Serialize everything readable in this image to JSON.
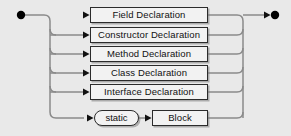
{
  "diagram": {
    "kind": "railroad-syntax-diagram",
    "canvas": {
      "width": 291,
      "height": 136
    },
    "colors": {
      "background": "#e9e9e9",
      "line": "#7a7a7a",
      "node_border": "#2b2b2b",
      "node_fill": "#f2f2f2",
      "terminator": "#000000",
      "text": "#111111"
    },
    "start_node": {
      "name": "start-terminator",
      "shape": "filled-circle",
      "cx": 21,
      "cy": 15,
      "r": 4.2
    },
    "end_node": {
      "name": "end-terminator",
      "shape": "arrow-filled-circle",
      "cx": 275,
      "cy": 15,
      "r": 4.2
    },
    "rails": {
      "left_spine_x": 50,
      "right_spine_x": 243,
      "main_line_y": 15,
      "corner_radius": 6
    },
    "alternatives": [
      {
        "id": "field-declaration",
        "label": "Field Declaration",
        "shape": "rect",
        "x": 90,
        "y": 7,
        "w": 118,
        "h": 16,
        "row_y": 15
      },
      {
        "id": "constructor-declaration",
        "label": "Constructor Declaration",
        "shape": "rect",
        "x": 90,
        "y": 27,
        "w": 118,
        "h": 16,
        "row_y": 35
      },
      {
        "id": "method-declaration",
        "label": "Method Declaration",
        "shape": "rect",
        "x": 90,
        "y": 46,
        "w": 118,
        "h": 16,
        "row_y": 54
      },
      {
        "id": "class-declaration",
        "label": "Class Declaration",
        "shape": "rect",
        "x": 90,
        "y": 65,
        "w": 118,
        "h": 16,
        "row_y": 73
      },
      {
        "id": "interface-declaration",
        "label": "Interface Declaration",
        "shape": "rect",
        "x": 90,
        "y": 84,
        "w": 118,
        "h": 16,
        "row_y": 92
      }
    ],
    "static_block_row": {
      "row_y": 118,
      "static_token": {
        "id": "static-keyword",
        "label": "static",
        "shape": "oval",
        "x": 94,
        "y": 110,
        "w": 45,
        "h": 16
      },
      "block_token": {
        "id": "block-nonterminal",
        "label": "Block",
        "shape": "rect",
        "x": 152,
        "y": 110,
        "w": 56,
        "h": 16
      }
    },
    "arrowheads": [
      {
        "name": "arrow-into-field-declaration",
        "x": 90,
        "y": 15
      },
      {
        "name": "arrow-into-constructor-declaration",
        "x": 90,
        "y": 35
      },
      {
        "name": "arrow-into-method-declaration",
        "x": 90,
        "y": 54
      },
      {
        "name": "arrow-into-class-declaration",
        "x": 90,
        "y": 73
      },
      {
        "name": "arrow-into-interface-declaration",
        "x": 90,
        "y": 92
      },
      {
        "name": "arrow-into-static-keyword",
        "x": 94,
        "y": 118
      },
      {
        "name": "arrow-into-block",
        "x": 152,
        "y": 118
      },
      {
        "name": "arrow-into-end-terminator",
        "x": 270,
        "y": 15
      }
    ]
  }
}
